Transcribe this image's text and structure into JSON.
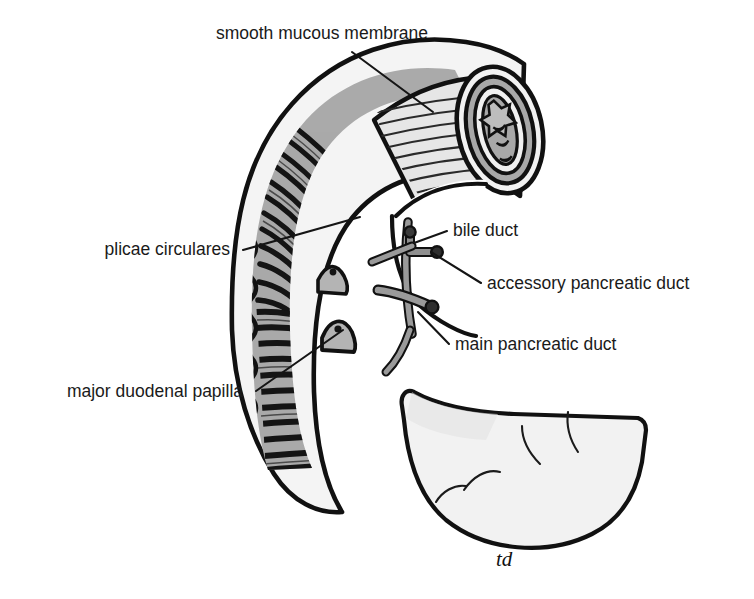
{
  "figure": {
    "background_color": "#ffffff",
    "signature": "td",
    "palette": {
      "outline": "#111111",
      "fold_dark": "#151515",
      "mucosa_gray": "#a8a8a8",
      "serosa_light": "#efefef",
      "duct_gray": "#8f8f8f",
      "smooth_mucosa": "#e4e4e4",
      "leader_line": "#151515",
      "text": "#1a1a1a"
    }
  },
  "labels": [
    {
      "id": "smooth-mucous-membrane",
      "text": "smooth mucous membrane",
      "anchor": "middle",
      "text_x": 322,
      "text_y": 39,
      "leader": {
        "x1": 352,
        "y1": 52,
        "x2": 433,
        "y2": 112
      }
    },
    {
      "id": "plicae-circulares",
      "text": "plicae circulares",
      "anchor": "end",
      "text_x": 230,
      "text_y": 255,
      "leader": {
        "x1": 243,
        "y1": 250,
        "x2": 360,
        "y2": 217
      }
    },
    {
      "id": "bile-duct",
      "text": "bile duct",
      "anchor": "start",
      "text_x": 453,
      "text_y": 236,
      "leader": {
        "x1": 447,
        "y1": 231,
        "x2": 414,
        "y2": 243
      }
    },
    {
      "id": "accessory-pancreatic-duct",
      "text": "accessory pancreatic duct",
      "anchor": "start",
      "text_x": 487,
      "text_y": 289,
      "leader": {
        "x1": 481,
        "y1": 283,
        "x2": 431,
        "y2": 252
      }
    },
    {
      "id": "main-pancreatic-duct",
      "text": "main pancreatic duct",
      "anchor": "start",
      "text_x": 455,
      "text_y": 350,
      "leader": {
        "x1": 449,
        "y1": 344,
        "x2": 418,
        "y2": 312
      }
    },
    {
      "id": "major-duodenal-papilla",
      "text": "major duodenal papilla",
      "anchor": "end",
      "text_x": 243,
      "text_y": 397,
      "leader": {
        "x1": 256,
        "y1": 391,
        "x2": 343,
        "y2": 330
      }
    }
  ],
  "structures": [
    {
      "id": "duodenal-c-loop",
      "name": "duodenum c-loop wall"
    },
    {
      "id": "cut-end-rings",
      "name": "cut cross-section concentric layers"
    },
    {
      "id": "plicae-folds",
      "name": "circular folds band set"
    },
    {
      "id": "smooth-region",
      "name": "smooth mucous membrane patch"
    },
    {
      "id": "major-papilla",
      "name": "major duodenal papilla bump"
    },
    {
      "id": "minor-papilla",
      "name": "minor duodenal papilla bump"
    },
    {
      "id": "bile-duct-stub",
      "name": "bile duct cut stub"
    },
    {
      "id": "accessory-duct-stub",
      "name": "accessory pancreatic duct cut stub"
    },
    {
      "id": "main-duct-stub",
      "name": "main pancreatic duct cut stub"
    },
    {
      "id": "distal-serosa",
      "name": "distal uncut duodenum outer surface"
    }
  ]
}
